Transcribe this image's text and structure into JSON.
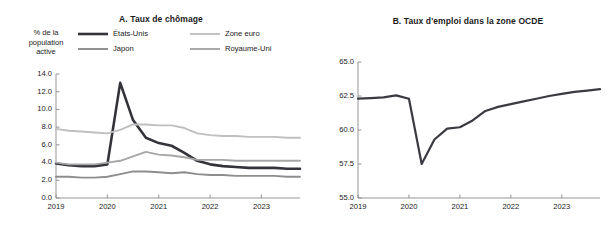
{
  "figure": {
    "background": "#ffffff",
    "text_color": "#1a1a1a"
  },
  "panel_a": {
    "title": "A. Taux de chômage",
    "axis_caption": "% de la\npopulation\nactive",
    "axis_caption_lines": [
      "% de la",
      "population",
      "active"
    ],
    "legend": [
      {
        "label": "États-Unis",
        "color": "#33343a",
        "width": 2.6
      },
      {
        "label": "Zone euro",
        "color": "#bfbfbf",
        "width": 1.9
      },
      {
        "label": "Japon",
        "color": "#8d8d8d",
        "width": 1.9
      },
      {
        "label": "Royaume-Uni",
        "color": "#a6a6a6",
        "width": 1.9
      }
    ],
    "ytick_labels": [
      "14.0",
      "12.0",
      "10.0",
      "8.0",
      "6.0",
      "4.0",
      "2.0",
      "0.0"
    ],
    "xtick_labels": [
      "2019",
      "2020",
      "2021",
      "2022",
      "2023"
    ]
  },
  "panel_b": {
    "title": "B. Taux d'emploi dans la zone OCDE",
    "axis_caption": "% de la\npopulation\nactive",
    "axis_caption_lines": [
      "% de la",
      "population",
      "active"
    ],
    "ytick_labels": [
      "65.0",
      "62.5",
      "60.0",
      "57.5",
      "55.0"
    ],
    "xtick_labels": [
      "2019",
      "2020",
      "2021",
      "2022",
      "2023"
    ]
  },
  "chart_data": [
    {
      "id": "panel-a",
      "type": "line",
      "title": "A. Taux de chômage",
      "xlabel": "",
      "ylabel": "% de la population active",
      "ylim": [
        0.0,
        14.0
      ],
      "yticks": [
        0.0,
        2.0,
        4.0,
        6.0,
        8.0,
        10.0,
        12.0,
        14.0
      ],
      "xlim": [
        2019.0,
        2023.75
      ],
      "xticks": [
        2019,
        2020,
        2021,
        2022,
        2023
      ],
      "grid": false,
      "legend_position": "top",
      "x": [
        2019.0,
        2019.25,
        2019.5,
        2019.75,
        2020.0,
        2020.25,
        2020.5,
        2020.75,
        2021.0,
        2021.25,
        2021.5,
        2021.75,
        2022.0,
        2022.25,
        2022.5,
        2022.75,
        2023.0,
        2023.25,
        2023.5,
        2023.75
      ],
      "series": [
        {
          "name": "États-Unis",
          "color": "#33343a",
          "width": 2.6,
          "values": [
            3.9,
            3.7,
            3.6,
            3.6,
            3.8,
            13.0,
            8.8,
            6.8,
            6.2,
            5.9,
            5.1,
            4.2,
            3.8,
            3.6,
            3.5,
            3.4,
            3.4,
            3.4,
            3.3,
            3.3
          ]
        },
        {
          "name": "Zone euro",
          "color": "#bfbfbf",
          "width": 1.9,
          "values": [
            7.8,
            7.6,
            7.5,
            7.4,
            7.3,
            7.7,
            8.3,
            8.3,
            8.2,
            8.2,
            7.9,
            7.3,
            7.1,
            7.0,
            7.0,
            6.9,
            6.9,
            6.9,
            6.8,
            6.8
          ]
        },
        {
          "name": "Japon",
          "color": "#8d8d8d",
          "width": 1.9,
          "values": [
            2.4,
            2.4,
            2.3,
            2.3,
            2.4,
            2.7,
            3.0,
            3.0,
            2.9,
            2.8,
            2.9,
            2.7,
            2.6,
            2.6,
            2.5,
            2.5,
            2.5,
            2.5,
            2.4,
            2.4
          ]
        },
        {
          "name": "Royaume-Uni",
          "color": "#a6a6a6",
          "width": 1.9,
          "values": [
            4.0,
            3.8,
            3.8,
            3.8,
            4.0,
            4.2,
            4.7,
            5.2,
            4.9,
            4.8,
            4.6,
            4.3,
            4.3,
            4.3,
            4.2,
            4.2,
            4.2,
            4.2,
            4.2,
            4.2
          ]
        }
      ]
    },
    {
      "id": "panel-b",
      "type": "line",
      "title": "B. Taux d'emploi dans la zone OCDE",
      "xlabel": "",
      "ylabel": "% de la population active",
      "ylim": [
        55.0,
        65.0
      ],
      "yticks": [
        55.0,
        57.5,
        60.0,
        62.5,
        65.0
      ],
      "xlim": [
        2019.0,
        2023.75
      ],
      "xticks": [
        2019,
        2020,
        2021,
        2022,
        2023
      ],
      "grid": false,
      "legend_position": "none",
      "x": [
        2019.0,
        2019.25,
        2019.5,
        2019.75,
        2020.0,
        2020.25,
        2020.5,
        2020.75,
        2021.0,
        2021.25,
        2021.5,
        2021.75,
        2022.0,
        2022.25,
        2022.5,
        2022.75,
        2023.0,
        2023.25,
        2023.5,
        2023.75
      ],
      "series": [
        {
          "name": "Taux d'emploi — zone OCDE",
          "color": "#3a3b40",
          "width": 2.2,
          "values": [
            62.3,
            62.35,
            62.4,
            62.55,
            62.3,
            57.5,
            59.3,
            60.1,
            60.2,
            60.7,
            61.4,
            61.7,
            61.9,
            62.1,
            62.3,
            62.5,
            62.65,
            62.8,
            62.9,
            63.0
          ]
        }
      ]
    }
  ]
}
